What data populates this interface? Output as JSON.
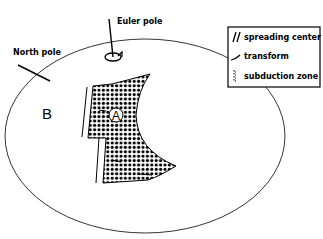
{
  "diagram": {
    "labels": {
      "euler_pole": "Euler pole",
      "north_pole": "North pole",
      "plate_b": "B",
      "plate_a": "A"
    },
    "legend": {
      "items": [
        {
          "symbol": "double-slash",
          "label": "spreading center"
        },
        {
          "symbol": "curved-stroke",
          "label": "transform"
        },
        {
          "symbol": "dotted-line",
          "label": "subduction zone"
        }
      ]
    },
    "colors": {
      "stroke": "#000000",
      "background": "#ffffff"
    }
  }
}
